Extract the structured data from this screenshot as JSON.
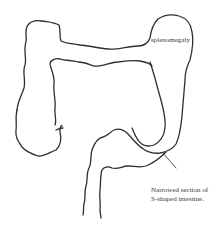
{
  "figure": {
    "stroke_color": "#2e2e2e",
    "background": "#ffffff"
  },
  "labels": {
    "splenomegaly": "splenomegaly",
    "narrowed_line1": "Narrowed section of",
    "narrowed_line2": "S-shaped intestine."
  }
}
